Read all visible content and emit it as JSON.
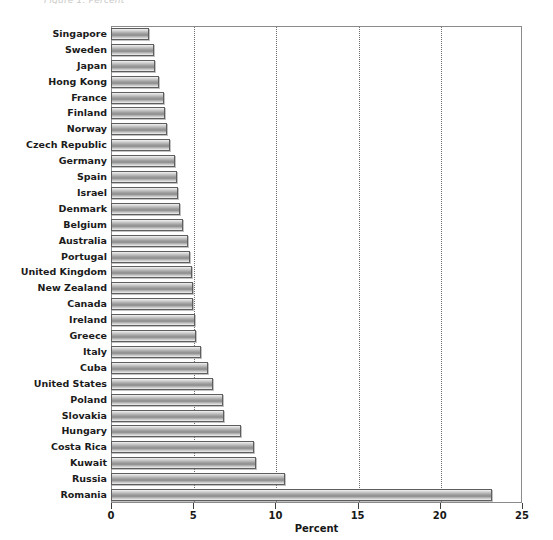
{
  "top_clipped_text": "Figure 1.  Percent",
  "chart_data": {
    "type": "bar",
    "orientation": "horizontal",
    "title": "",
    "subtitle": "",
    "xlabel": "Percent",
    "ylabel": "",
    "xlim": [
      0,
      25
    ],
    "ylim": null,
    "xticks": [
      0,
      5,
      10,
      15,
      20,
      25
    ],
    "xtick_labels": [
      "0",
      "5",
      "10",
      "15",
      "20",
      "25"
    ],
    "gridlines": {
      "x": [
        5,
        10,
        15,
        20
      ],
      "style": "dotted",
      "y": false
    },
    "legend": null,
    "legend_position": "none",
    "bar_style": {
      "fill": "vertical-gray-gradient",
      "edge_color": "#5e5e5e",
      "light": "#f2f2f2",
      "dark": "#8c8c8c"
    },
    "categories": [
      "Singapore",
      "Sweden",
      "Japan",
      "Hong Kong",
      "France",
      "Finland",
      "Norway",
      "Czech Republic",
      "Germany",
      "Spain",
      "Israel",
      "Denmark",
      "Belgium",
      "Australia",
      "Portugal",
      "United Kingdom",
      "New Zealand",
      "Canada",
      "Ireland",
      "Greece",
      "Italy",
      "Cuba",
      "United States",
      "Poland",
      "Slovakia",
      "Hungary",
      "Costa Rica",
      "Kuwait",
      "Russia",
      "Romania"
    ],
    "values": [
      2.3,
      2.6,
      2.7,
      2.9,
      3.2,
      3.3,
      3.4,
      3.6,
      3.9,
      4.0,
      4.1,
      4.2,
      4.4,
      4.7,
      4.8,
      4.9,
      5.0,
      5.0,
      5.1,
      5.2,
      5.5,
      5.9,
      6.2,
      6.8,
      6.9,
      7.9,
      8.7,
      8.8,
      10.6,
      23.2
    ]
  }
}
